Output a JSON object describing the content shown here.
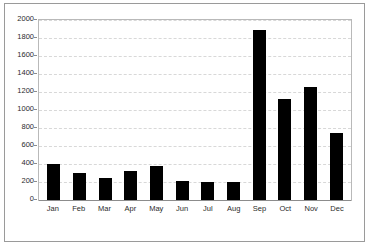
{
  "chart_data": {
    "type": "bar",
    "title": "",
    "subtitle": "",
    "xlabel": "",
    "ylabel": "",
    "categories": [
      "Jan",
      "Feb",
      "Mar",
      "Apr",
      "May",
      "Jun",
      "Jul",
      "Aug",
      "Sep",
      "Oct",
      "Nov",
      "Dec"
    ],
    "values": [
      400,
      300,
      250,
      320,
      380,
      210,
      200,
      195,
      1890,
      1120,
      1260,
      740
    ],
    "ylim": [
      0,
      2000
    ],
    "yticks": [
      0,
      200,
      400,
      600,
      800,
      1000,
      1200,
      1400,
      1600,
      1800,
      2000
    ],
    "ytick_labels": [
      "0",
      "200",
      "400",
      "600",
      "800",
      "1000",
      "1200",
      "1400",
      "1600",
      "1800",
      "2000"
    ],
    "grid": true,
    "grid_axis": "y",
    "legend": false,
    "legend_position": "none",
    "bar_color": "#000000",
    "grid_color": "#d8d8d8",
    "axis_color": "#8c8c8c",
    "frame_color": "#9a9a9a",
    "background_color": "#ffffff"
  }
}
